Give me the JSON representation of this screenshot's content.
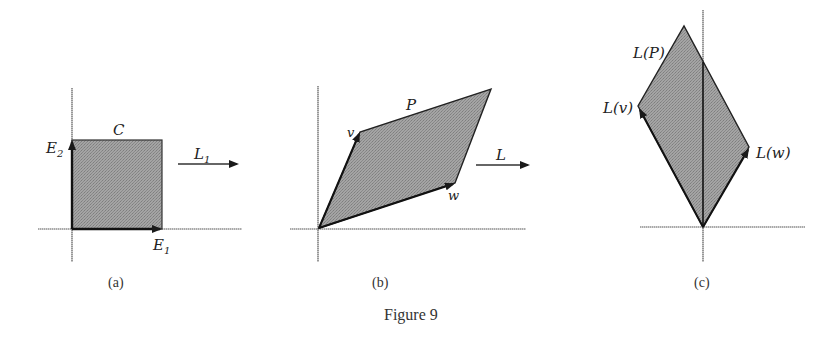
{
  "figure": {
    "caption": "Figure 9",
    "fill_color": "#9a9a9a",
    "edge_color": "#1a1a1a",
    "axis_color": "#555555"
  },
  "panels": [
    {
      "id": "a",
      "caption": "(a)",
      "region_label": "C",
      "vector1_label": "E",
      "vector1_sub": "1",
      "vector2_label": "E",
      "vector2_sub": "2",
      "map_label": "L",
      "map_sub": "1"
    },
    {
      "id": "b",
      "caption": "(b)",
      "region_label": "P",
      "vector1_label": "v",
      "vector2_label": "w",
      "map_label": "L"
    },
    {
      "id": "c",
      "caption": "(c)",
      "region_label": "L(P)",
      "vector1_label": "L(v)",
      "vector2_label": "L(w)"
    }
  ]
}
